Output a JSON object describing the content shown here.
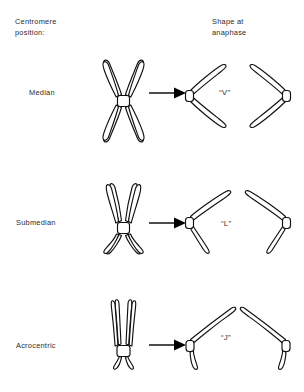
{
  "figure": {
    "title_left": "Centromere\nposition:",
    "title_right": "Shape at\nanaphase",
    "background_color": "#ffffff",
    "line_color": "#111111",
    "text_color": "#2b2b2b"
  },
  "rows": [
    {
      "label": "Median",
      "shape_label": "“V”",
      "metaphase": "x-shaped-chromosome",
      "anaphase_left": "v-chromatid-opening-right",
      "anaphase_right": "v-chromatid-opening-left",
      "arrow": "right-arrow"
    },
    {
      "label": "Submedian",
      "shape_label": "“L”",
      "metaphase": "submedian-chromosome",
      "anaphase_left": "l-chromatid-opening-right",
      "anaphase_right": "l-chromatid-opening-left",
      "arrow": "right-arrow"
    },
    {
      "label": "Acrocentric",
      "shape_label": "“J”",
      "metaphase": "acrocentric-chromosome",
      "anaphase_left": "j-chromatid-opening-right",
      "anaphase_right": "j-chromatid-opening-left",
      "arrow": "right-arrow"
    }
  ]
}
